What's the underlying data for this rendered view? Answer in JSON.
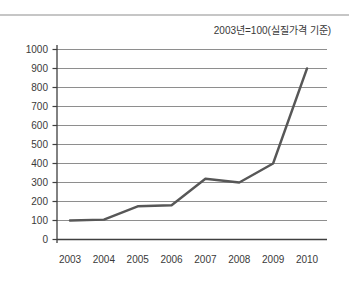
{
  "page": {
    "background": "#ffffff",
    "divider_color": "#c6c6c6"
  },
  "chart": {
    "title": "2003년=100(실질가격 기준)",
    "colors": {
      "series": "#575757",
      "grid": "#8e8e8e",
      "axis": "#3f3f3f",
      "text": "#3a3a3a"
    }
  },
  "chart_data": {
    "type": "line",
    "title": "2003년=100(실질가격 기준)",
    "categories": [
      "2003",
      "2004",
      "2005",
      "2006",
      "2007",
      "2008",
      "2009",
      "2010"
    ],
    "values": [
      100,
      105,
      175,
      180,
      320,
      300,
      400,
      900
    ],
    "series": [
      {
        "name": "실질가격 지수",
        "values": [
          100,
          105,
          175,
          180,
          320,
          300,
          400,
          900
        ]
      }
    ],
    "xlabel": "",
    "ylabel": "",
    "ylim": [
      0,
      1000
    ],
    "ytick_step": 100,
    "yticks": [
      0,
      100,
      200,
      300,
      400,
      500,
      600,
      700,
      800,
      900,
      1000
    ],
    "grid": true,
    "legend": false
  }
}
